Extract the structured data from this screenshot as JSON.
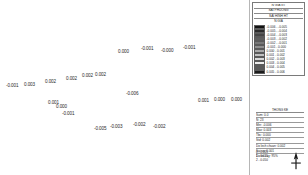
{
  "map": {
    "name": "residual-value-map",
    "point_labels": [
      {
        "text": "-0.001",
        "x": 6,
        "y": 84
      },
      {
        "text": "0.003",
        "x": 24,
        "y": 83
      },
      {
        "text": "0.002",
        "x": 45,
        "y": 80
      },
      {
        "text": "0.002",
        "x": 66,
        "y": 77
      },
      {
        "text": "0.002",
        "x": 82,
        "y": 74
      },
      {
        "text": "0.002",
        "x": 95,
        "y": 73
      },
      {
        "text": "0.000",
        "x": 118,
        "y": 50
      },
      {
        "text": "-0.001",
        "x": 141,
        "y": 47
      },
      {
        "text": "-0.000",
        "x": 161,
        "y": 49
      },
      {
        "text": "-0.001",
        "x": 183,
        "y": 46
      },
      {
        "text": "-0.006",
        "x": 126,
        "y": 92
      },
      {
        "text": "0.001",
        "x": 48,
        "y": 101
      },
      {
        "text": "0.000",
        "x": 56,
        "y": 105
      },
      {
        "text": "-0.001",
        "x": 62,
        "y": 112
      },
      {
        "text": "-0.005",
        "x": 94,
        "y": 127
      },
      {
        "text": "-0.003",
        "x": 110,
        "y": 125
      },
      {
        "text": "-0.002",
        "x": 133,
        "y": 123
      },
      {
        "text": "-0.002",
        "x": 153,
        "y": 125
      },
      {
        "text": "0.001",
        "x": 198,
        "y": 99
      },
      {
        "text": "0.000",
        "x": 214,
        "y": 98
      },
      {
        "text": "0.000",
        "x": 231,
        "y": 98
      },
      {
        "text": "0.000",
        "x": 248,
        "y": 102
      },
      {
        "text": "0.001",
        "x": 266,
        "y": 99
      }
    ]
  },
  "legend": {
    "name": "map-legend",
    "title_line1": "N GIA GT",
    "title_line2": "SAI PHUONG",
    "title_line3": "SAI HINH HT",
    "header": "N GIA",
    "classes": [
      {
        "label": "-0.006 - -0.005",
        "color": "#111111"
      },
      {
        "label": "-0.005 - -0.004",
        "color": "#2a2a2a"
      },
      {
        "label": "-0.004 - -0.003",
        "color": "#454545"
      },
      {
        "label": "-0.003 - -0.002",
        "color": "#5e5e5e"
      },
      {
        "label": "-0.002 - -0.001",
        "color": "#787878"
      },
      {
        "label": "-0.001 - 0.000",
        "color": "#8f8f8f"
      },
      {
        "label": "0.000 - 0.001",
        "color": "#a8a8a8"
      },
      {
        "label": "0.001 - 0.002",
        "color": "#c0c0c0"
      },
      {
        "label": "0.002 - 0.003",
        "color": "#d8d8d8"
      },
      {
        "label": "0.003 - 0.004",
        "color": "#ededed"
      },
      {
        "label": "0.004 - 0.005",
        "color": "#5a5a5a"
      },
      {
        "label": "0.005 - 0.006",
        "color": "#1c1c1c"
      }
    ]
  },
  "stats": {
    "name": "statistics-panel",
    "title": "THONG KE",
    "rows": [
      "Sum: 0.0",
      "N: 23",
      "Min: -0.006",
      "Max: 0.003",
      "Tbc: 0.000",
      "Std: 0.002",
      "Do lech chuan: 0.002",
      "Sai so: 0.001",
      "Do tin cay: 95%"
    ]
  },
  "scalebar": {
    "name": "scale-bar",
    "ticks": [
      "0 - 0.005",
      "1 - 0.025",
      "2 - 0.050"
    ]
  },
  "north": {
    "name": "north-arrow",
    "label": "N"
  }
}
